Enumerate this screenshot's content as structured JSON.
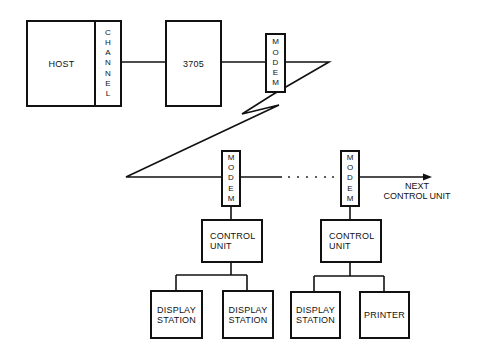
{
  "diagram": {
    "title": "",
    "nodes": {
      "host": {
        "label": "HOST"
      },
      "channel": {
        "label": "CHANNEL",
        "letters": [
          "C",
          "H",
          "A",
          "N",
          "N",
          "E",
          "L"
        ]
      },
      "controller": {
        "label": "3705"
      },
      "modem_top": {
        "label": "MODEM",
        "letters": [
          "M",
          "O",
          "D",
          "E",
          "M"
        ]
      },
      "modem_left": {
        "label": "MODEM",
        "letters": [
          "M",
          "O",
          "D",
          "E",
          "M"
        ]
      },
      "modem_right": {
        "label": "MODEM",
        "letters": [
          "M",
          "O",
          "D",
          "E",
          "M"
        ]
      },
      "control_unit_left": {
        "line1": "CONTROL",
        "line2": "UNIT"
      },
      "control_unit_right": {
        "line1": "CONTROL",
        "line2": "UNIT"
      },
      "display_station_1": {
        "line1": "DISPLAY",
        "line2": "STATION"
      },
      "display_station_2": {
        "line1": "DISPLAY",
        "line2": "STATION"
      },
      "display_station_3": {
        "line1": "DISPLAY",
        "line2": "STATION"
      },
      "printer": {
        "label": "PRINTER"
      }
    },
    "annotations": {
      "next_line1": "NEXT",
      "next_line2": "CONTROL UNIT",
      "ellipsis": ". . . . . ."
    },
    "edges": [
      {
        "from": "channel",
        "to": "3705",
        "type": "line"
      },
      {
        "from": "3705",
        "to": "modem_top",
        "type": "line"
      },
      {
        "from": "modem_top",
        "to": "modem_left",
        "type": "telecommunication-link-zigzag"
      },
      {
        "from": "modem_left",
        "to": "modem_right",
        "type": "dotted-continuation"
      },
      {
        "from": "modem_right",
        "to": "next control unit",
        "type": "arrow"
      },
      {
        "from": "modem_left",
        "to": "control_unit_left",
        "type": "line"
      },
      {
        "from": "modem_right",
        "to": "control_unit_right",
        "type": "line"
      },
      {
        "from": "control_unit_left",
        "to": "display_station_1",
        "type": "line"
      },
      {
        "from": "control_unit_left",
        "to": "display_station_2",
        "type": "line"
      },
      {
        "from": "control_unit_right",
        "to": "display_station_3",
        "type": "line"
      },
      {
        "from": "control_unit_right",
        "to": "printer",
        "type": "line"
      }
    ],
    "colors": {
      "stroke": "#111111",
      "background": "#ffffff"
    }
  }
}
